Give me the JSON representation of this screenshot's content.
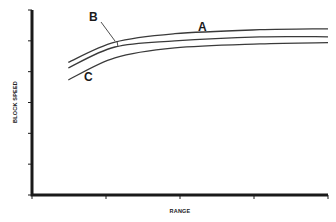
{
  "chart_data": {
    "type": "line",
    "title": "",
    "xlabel": "RANGE",
    "ylabel": "BLOCK SPEED",
    "xlim": [
      0,
      4
    ],
    "ylim": [
      0,
      6
    ],
    "x_ticks": [
      0,
      1,
      2,
      3,
      4
    ],
    "y_ticks": [
      0,
      1,
      2,
      3,
      4,
      5,
      6
    ],
    "x_tick_labels": [],
    "y_tick_labels": [],
    "grid": false,
    "legend": "none (curves labeled directly)",
    "series": [
      {
        "name": "A",
        "x": [
          0.49,
          1.12,
          1.93,
          3.08,
          4.0
        ],
        "values": [
          4.3,
          4.96,
          5.23,
          5.36,
          5.39
        ]
      },
      {
        "name": "B",
        "x": [
          0.49,
          1.12,
          1.93,
          3.08,
          4.0
        ],
        "values": [
          4.12,
          4.8,
          5.0,
          5.13,
          5.13
        ]
      },
      {
        "name": "C",
        "x": [
          0.49,
          1.12,
          1.93,
          3.08,
          4.0
        ],
        "values": [
          3.73,
          4.45,
          4.77,
          4.9,
          4.94
        ]
      }
    ],
    "annotations": [
      {
        "text": "A",
        "near_series": "A",
        "position": "above curve, mid-right"
      },
      {
        "text": "B",
        "near_series": "B",
        "position": "leader line pointing to curve B at x≈1.15"
      },
      {
        "text": "C",
        "near_series": "C",
        "position": "below curve, left"
      }
    ]
  },
  "labels": {
    "x_axis": "RANGE",
    "y_axis": "BLOCK SPEED",
    "curve_a": "A",
    "curve_b": "B",
    "curve_c": "C"
  },
  "colors": {
    "axis": "#1a1a1a",
    "curve": "#3a3a3a",
    "background": "#ffffff"
  }
}
